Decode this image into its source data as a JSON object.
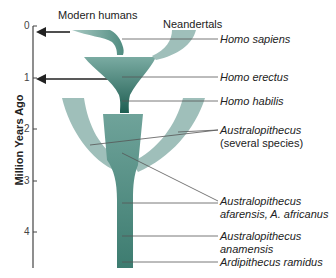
{
  "diagram": {
    "y_axis": {
      "title": "Million Years Ago",
      "ticks": [
        "0",
        "1",
        "2",
        "3",
        "4"
      ]
    },
    "top_labels": {
      "modern_humans": "Modern humans",
      "neandertals": "Neandertals"
    },
    "species_labels": [
      {
        "line1": "Homo sapiens"
      },
      {
        "line1": "Homo erectus"
      },
      {
        "line1": "Homo habilis"
      },
      {
        "line1": "Australopithecus",
        "line2": "(several species)"
      },
      {
        "line1": "Australopithecus",
        "line2": "afarensis, A. africanus"
      },
      {
        "line1": "Australopithecus",
        "line2": "anamensis"
      },
      {
        "line1": "Ardipithecus ramidus"
      }
    ],
    "colors": {
      "dark_teal": "#2f6e62",
      "mid_teal": "#5a948a",
      "light_teal": "#9fbfba",
      "axis": "#333333",
      "leader_line": "#666666"
    }
  }
}
